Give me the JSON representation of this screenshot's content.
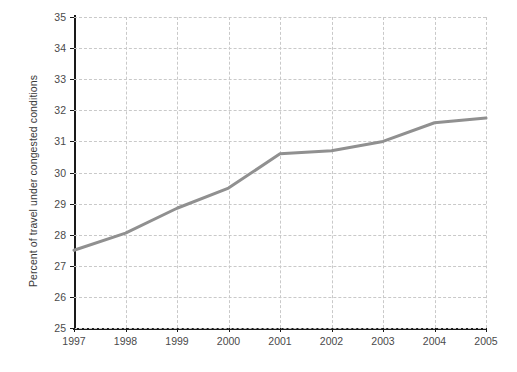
{
  "chart_data": {
    "type": "line",
    "title": "",
    "xlabel": "",
    "ylabel": "Percent of travel under congested conditions",
    "categories": [
      "1997",
      "1998",
      "1999",
      "2000",
      "2001",
      "2002",
      "2003",
      "2004",
      "2005"
    ],
    "x": [
      1997,
      1998,
      1999,
      2000,
      2001,
      2002,
      2003,
      2004,
      2005
    ],
    "values": [
      27.5,
      28.05,
      28.85,
      29.5,
      30.6,
      30.7,
      31.0,
      31.6,
      31.75
    ],
    "series": [
      {
        "name": "Percent of travel under congested conditions",
        "values": [
          27.5,
          28.05,
          28.85,
          29.5,
          30.6,
          30.7,
          31.0,
          31.6,
          31.75
        ],
        "color": "#909090"
      }
    ],
    "ylim": [
      25,
      35
    ],
    "xlim": [
      1997,
      2005
    ],
    "yticks": [
      25,
      26,
      27,
      28,
      29,
      30,
      31,
      32,
      33,
      34,
      35
    ],
    "ytick_labels": [
      "25",
      "26",
      "27",
      "28",
      "29",
      "30",
      "31",
      "32",
      "33",
      "34",
      "35"
    ],
    "xticks": [
      1997,
      1998,
      1999,
      2000,
      2001,
      2002,
      2003,
      2004,
      2005
    ],
    "xtick_labels": [
      "1997",
      "1998",
      "1999",
      "2000",
      "2001",
      "2002",
      "2003",
      "2004",
      "2005"
    ],
    "grid": true,
    "grid_style": "dashed",
    "grid_color": "#c9c9c9",
    "legend": false,
    "legend_position": "none",
    "line_width": 3,
    "axis_color": "#1a1a1a",
    "background_color": "#ffffff",
    "tick_label_color": "#4a4a4a"
  }
}
